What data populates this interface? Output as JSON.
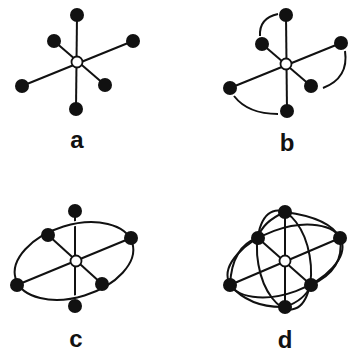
{
  "panels": [
    {
      "id": "a",
      "label": "a",
      "description": "star graph: hub with six spokes"
    },
    {
      "id": "b",
      "label": "b",
      "description": "star graph with three arcs pairing adjacent leaves"
    },
    {
      "id": "c",
      "label": "c",
      "description": "star graph with one ellipse through four leaves"
    },
    {
      "id": "d",
      "label": "d",
      "description": "star graph with three ellipses through leaves"
    }
  ],
  "colors": {
    "ink": "#111111",
    "hub_fill": "#ffffff",
    "background": "#ffffff"
  }
}
